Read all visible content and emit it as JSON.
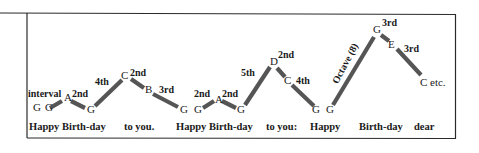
{
  "colors": {
    "border": "#2a2a2a",
    "bar": "#555555",
    "text": "#1a1a1a",
    "background": "#ffffff"
  },
  "labels": {
    "interval_word": "interval",
    "etc": "etc."
  },
  "notes": [
    {
      "id": "n1",
      "name": "G",
      "x": 33,
      "y": 111
    },
    {
      "id": "n2",
      "name": "G",
      "x": 45,
      "y": 111
    },
    {
      "id": "n3",
      "name": "A",
      "x": 64,
      "y": 101
    },
    {
      "id": "n4",
      "name": "G",
      "x": 87,
      "y": 113
    },
    {
      "id": "n5",
      "name": "C",
      "x": 121,
      "y": 79
    },
    {
      "id": "n6",
      "name": "B",
      "x": 145,
      "y": 93
    },
    {
      "id": "n7",
      "name": "G",
      "x": 180,
      "y": 113
    },
    {
      "id": "n8",
      "name": "G",
      "x": 194,
      "y": 113
    },
    {
      "id": "n9",
      "name": "A",
      "x": 215,
      "y": 103
    },
    {
      "id": "n10",
      "name": "G",
      "x": 237,
      "y": 113
    },
    {
      "id": "n11",
      "name": "D",
      "x": 270,
      "y": 65
    },
    {
      "id": "n12",
      "name": "C",
      "x": 284,
      "y": 84
    },
    {
      "id": "n13",
      "name": "G",
      "x": 312,
      "y": 113
    },
    {
      "id": "n14",
      "name": "G",
      "x": 326,
      "y": 113
    },
    {
      "id": "n15",
      "name": "G",
      "x": 373,
      "y": 33
    },
    {
      "id": "n16",
      "name": "E",
      "x": 388,
      "y": 48
    },
    {
      "id": "n17",
      "name": "C",
      "x": 420,
      "y": 86
    }
  ],
  "intervals": [
    {
      "label": "interval",
      "x": 28,
      "y": 97
    },
    {
      "label": "2nd",
      "x": 72,
      "y": 97
    },
    {
      "label": "4th",
      "x": 95,
      "y": 85
    },
    {
      "label": "2nd",
      "x": 130,
      "y": 76
    },
    {
      "label": "3rd",
      "x": 159,
      "y": 93
    },
    {
      "label": "2nd",
      "x": 194,
      "y": 97
    },
    {
      "label": "2nd",
      "x": 222,
      "y": 97
    },
    {
      "label": "5th",
      "x": 241,
      "y": 76
    },
    {
      "label": "2nd",
      "x": 278,
      "y": 58
    },
    {
      "label": "4th",
      "x": 296,
      "y": 84
    },
    {
      "label": "3rd",
      "x": 382,
      "y": 26
    },
    {
      "label": "3rd",
      "x": 404,
      "y": 52
    }
  ],
  "octave_label": {
    "text": "Octave (8)",
    "x": 348,
    "y": 65,
    "rotate": -62
  },
  "bars": [
    {
      "x1": 50,
      "y1": 108,
      "x2": 62,
      "y2": 101
    },
    {
      "x1": 71,
      "y1": 101,
      "x2": 85,
      "y2": 108
    },
    {
      "x1": 95,
      "y1": 106,
      "x2": 122,
      "y2": 80
    },
    {
      "x1": 131,
      "y1": 79,
      "x2": 144,
      "y2": 88
    },
    {
      "x1": 153,
      "y1": 94,
      "x2": 178,
      "y2": 107
    },
    {
      "x1": 203,
      "y1": 108,
      "x2": 214,
      "y2": 101
    },
    {
      "x1": 222,
      "y1": 101,
      "x2": 236,
      "y2": 108
    },
    {
      "x1": 245,
      "y1": 105,
      "x2": 270,
      "y2": 67
    },
    {
      "x1": 277,
      "y1": 68,
      "x2": 285,
      "y2": 77
    },
    {
      "x1": 292,
      "y1": 85,
      "x2": 314,
      "y2": 106
    },
    {
      "x1": 333,
      "y1": 105,
      "x2": 374,
      "y2": 37
    },
    {
      "x1": 381,
      "y1": 35,
      "x2": 389,
      "y2": 41
    },
    {
      "x1": 397,
      "y1": 49,
      "x2": 421,
      "y2": 75
    }
  ],
  "lyrics": [
    {
      "text": "Happy Birth-day",
      "x": 29,
      "y": 130
    },
    {
      "text": "to you.",
      "x": 124,
      "y": 130
    },
    {
      "text": "Happy Birth-day",
      "x": 176,
      "y": 130
    },
    {
      "text": "to you:",
      "x": 266,
      "y": 130
    },
    {
      "text": "Happy",
      "x": 310,
      "y": 130
    },
    {
      "text": "Birth-day",
      "x": 359,
      "y": 130
    },
    {
      "text": "dear",
      "x": 414,
      "y": 130
    }
  ],
  "etc_label": {
    "text": "etc.",
    "x": 430,
    "y": 86
  }
}
